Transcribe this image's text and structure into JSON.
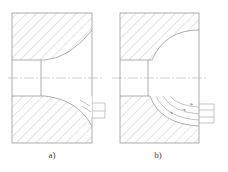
{
  "figure": {
    "panels": [
      {
        "id": "a",
        "label": "a)",
        "description": "Die cross-section with shallow concave entry; flow lines only near exit"
      },
      {
        "id": "b",
        "label": "b)",
        "description": "Die cross-section with large radius concave entry; concentric flow arcs with arrows"
      }
    ]
  },
  "style": {
    "line_color": "#9a9a9a",
    "hatch_color": "#b8b8b8",
    "centerline_color": "#b0b0b0",
    "background": "#ffffff"
  }
}
